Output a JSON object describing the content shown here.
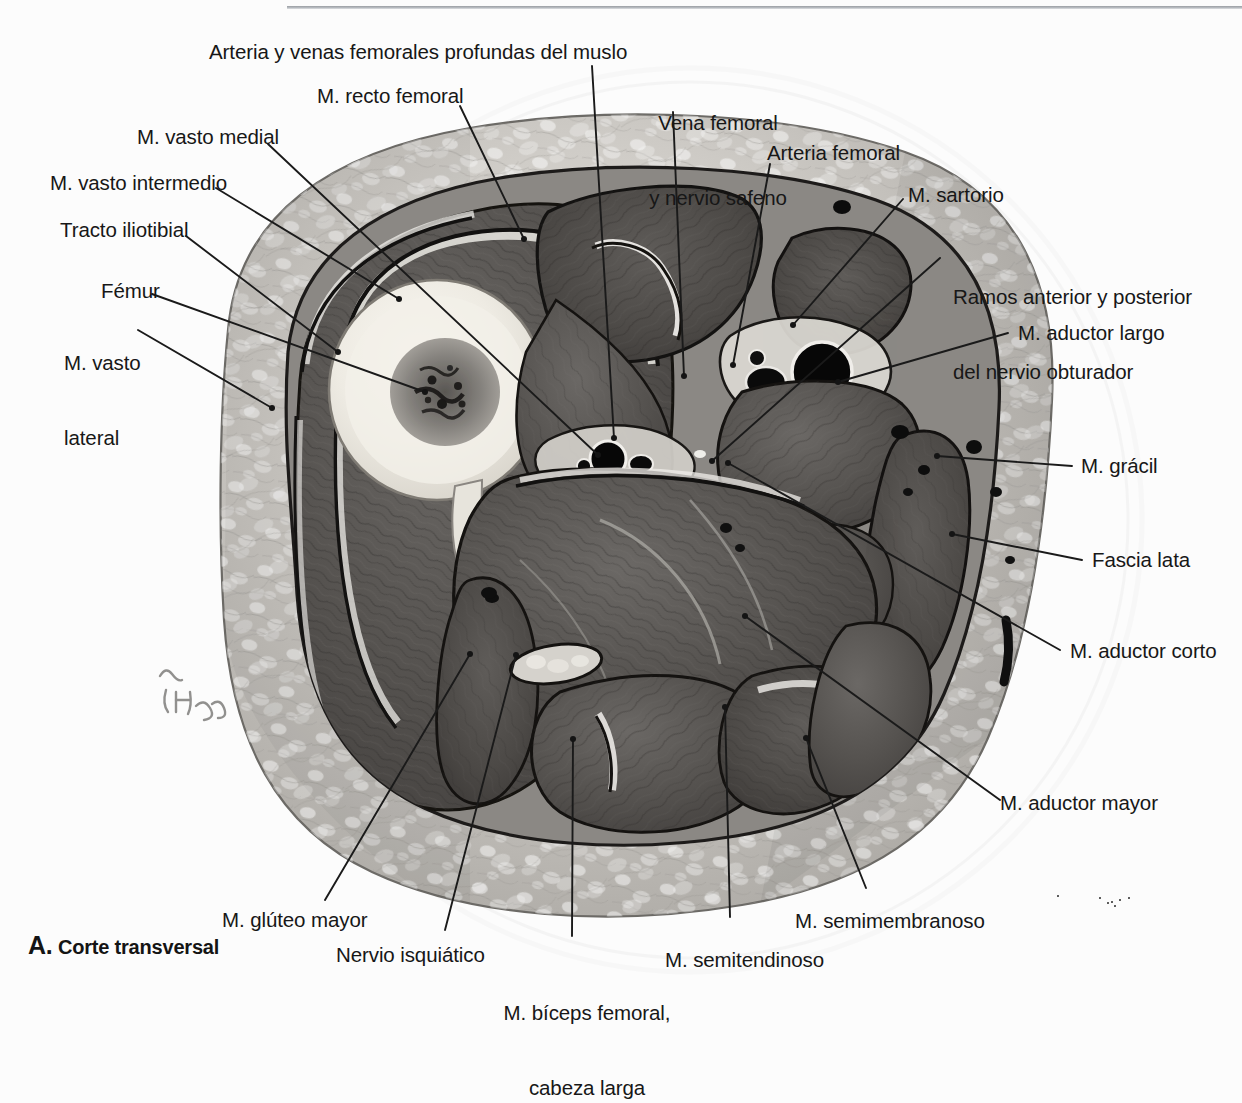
{
  "figure": {
    "caption_letter": "A.",
    "caption_text": "Corte transversal",
    "signature": "Netter"
  },
  "labels": {
    "arteria_venas_profundas": "Arteria y venas femorales profundas del muslo",
    "recto_femoral": "M. recto femoral",
    "vasto_medial": "M. vasto medial",
    "vasto_intermedio": "M. vasto intermedio",
    "tracto_iliotibial": "Tracto iliotibial",
    "femur": "Fémur",
    "vasto_lateral_l1": "M. vasto",
    "vasto_lateral_l2": "lateral",
    "vena_femoral_l1": "Vena femoral",
    "vena_femoral_l2": "y nervio safeno",
    "arteria_femoral": "Arteria femoral",
    "sartorio": "M. sartorio",
    "nervio_obturador_l1": "Ramos anterior y posterior",
    "nervio_obturador_l2": "del nervio obturador",
    "aductor_largo": "M. aductor largo",
    "gracil": "M. grácil",
    "fascia_lata": "Fascia lata",
    "aductor_corto": "M. aductor corto",
    "aductor_mayor": "M. aductor mayor",
    "semimembranoso": "M. semimembranoso",
    "semitendinoso": "M. semitendinoso",
    "biceps_femoral_l1": "M. bíceps femoral,",
    "biceps_femoral_l2": "cabeza larga",
    "nervio_isquiatico": "Nervio isquiático",
    "gluteo_mayor": "M. glúteo mayor"
  },
  "colors": {
    "background": "#fcfcfc",
    "rule": "#9a9ea3",
    "text": "#171717",
    "leader": "#1a1a1a",
    "fat": "#b9b6b2",
    "fat_light": "#d9d6d2",
    "muscle_dark": "#4a4745",
    "muscle_mid": "#5d5a57",
    "bone_cortex": "#efece5",
    "marrow": "#6d6a66",
    "fascia": "#121212",
    "vessel": "#0b0b0b"
  }
}
